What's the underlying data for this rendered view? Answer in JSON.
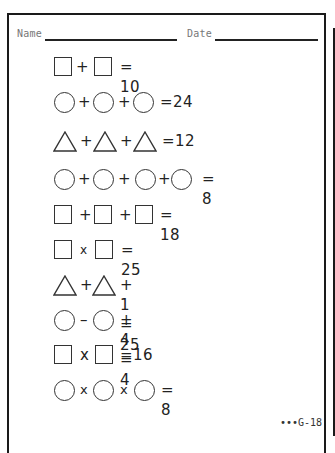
{
  "header": {
    "name_label": "Name",
    "date_label": "Date"
  },
  "equations": [
    {
      "rhs": "= 10"
    },
    {
      "rhs": "=24"
    },
    {
      "rhs": "=12"
    },
    {
      "rhs": "= 8"
    },
    {
      "rhs": "= 18"
    },
    {
      "rhs": "= 25"
    },
    {
      "rhs": "+ 1 = 25"
    },
    {
      "rhs": "+ 4 = 4"
    },
    {
      "rhs": "=16"
    },
    {
      "rhs": "= 8"
    }
  ],
  "operators": {
    "plus": "+",
    "minus": "–",
    "times": "x"
  },
  "footer": {
    "code": "•••G-18"
  }
}
